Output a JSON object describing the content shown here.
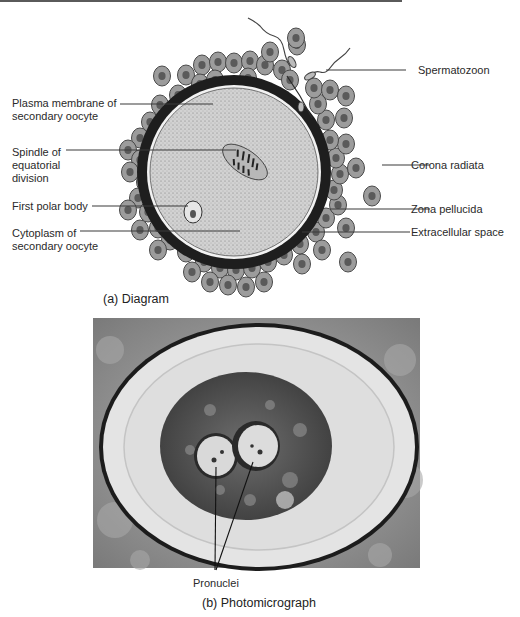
{
  "figure": {
    "panel_a": {
      "caption": "(a) Diagram",
      "labels_left": [
        {
          "id": "plasma-membrane",
          "text": "Plasma membrane of\nsecondary oocyte"
        },
        {
          "id": "spindle",
          "text": "Spindle of\nequatorial\ndivision"
        },
        {
          "id": "first-polar-body",
          "text": "First polar body"
        },
        {
          "id": "cytoplasm",
          "text": "Cytoplasm of\nsecondary oocyte"
        }
      ],
      "labels_right": [
        {
          "id": "spermatozoon",
          "text": "Spermatozoon"
        },
        {
          "id": "corona-radiata",
          "text": "Corona radiata"
        },
        {
          "id": "zona-pellucida",
          "text": "Zona pellucida"
        },
        {
          "id": "extracellular-space",
          "text": "Extracellular space"
        }
      ]
    },
    "panel_b": {
      "caption": "(b) Photomicrograph",
      "pointer_label": "Pronuclei"
    }
  },
  "colors": {
    "zona": "#1e1e1e",
    "ooplasm": "#cfcfcf",
    "cell_fill": "#9a9a9a",
    "cell_nucleus": "#555555",
    "leader_line": "#3a3a3a"
  }
}
